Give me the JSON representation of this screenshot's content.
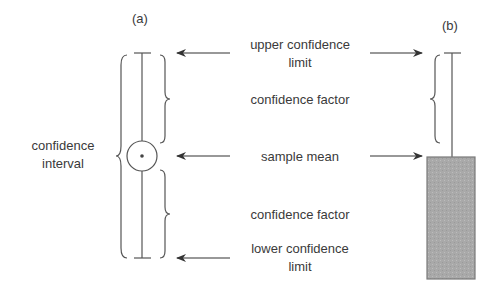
{
  "panels": {
    "a": {
      "label": "(a)"
    },
    "b": {
      "label": "(b)"
    }
  },
  "labels": {
    "confidence_interval_line1": "confidence",
    "confidence_interval_line2": "interval",
    "upper_limit_line1": "upper confidence",
    "upper_limit_line2": "limit",
    "confidence_factor_upper": "confidence factor",
    "sample_mean": "sample mean",
    "confidence_factor_lower": "confidence factor",
    "lower_limit_line1": "lower confidence",
    "lower_limit_line2": "limit"
  },
  "colors": {
    "stroke": "#555555",
    "bar_fill": "#a9a9a9",
    "bar_border": "#7a7a7a"
  }
}
